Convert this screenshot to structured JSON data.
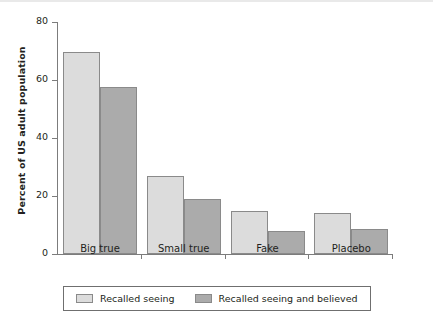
{
  "chart_data": {
    "type": "bar",
    "title": "",
    "xlabel": "",
    "ylabel": "Percent of US adult population",
    "categories": [
      "Big true",
      "Small true",
      "Fake",
      "Placebo"
    ],
    "series": [
      {
        "name": "Recalled seeing",
        "color": "#dcdcdc",
        "values": [
          69.5,
          27,
          15,
          14
        ]
      },
      {
        "name": "Recalled seeing and believed",
        "color": "#ababab",
        "values": [
          57.5,
          19,
          8,
          8.5
        ]
      }
    ],
    "ylim": [
      0,
      80
    ],
    "yticks": [
      0,
      20,
      40,
      60,
      80
    ],
    "ytick_labels": [
      "0",
      "20",
      "40",
      "60",
      "80"
    ],
    "grid": false,
    "legend_position": "bottom"
  },
  "axis": {
    "y_label": "Percent of US adult population",
    "tick_labels": [
      "80",
      "60",
      "40",
      "20",
      "0"
    ]
  },
  "legend": {
    "items": [
      {
        "label": "Recalled seeing",
        "swatch": "light-gray-swatch"
      },
      {
        "label": "Recalled seeing and believed",
        "swatch": "dark-gray-swatch"
      }
    ]
  }
}
